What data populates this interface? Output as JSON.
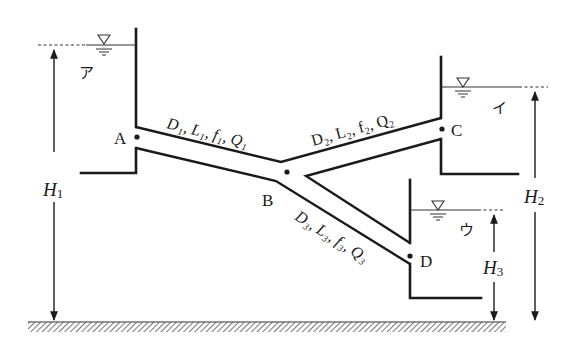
{
  "diagram": {
    "reservoirs": [
      {
        "id": "ア",
        "label": "ア",
        "head_label": "H",
        "head_sub": "1"
      },
      {
        "id": "イ",
        "label": "イ",
        "head_label": "H",
        "head_sub": "2"
      },
      {
        "id": "ウ",
        "label": "ウ",
        "head_label": "H",
        "head_sub": "3"
      }
    ],
    "nodes": {
      "A": "A",
      "B": "B",
      "C": "C",
      "D": "D"
    },
    "pipes": [
      {
        "id": "pipe1",
        "from": "A",
        "to": "B",
        "label": "D₁, L₁, f₁, Q₁"
      },
      {
        "id": "pipe2",
        "from": "B",
        "to": "C",
        "label": "D₂, L₂, f₂, Q₂"
      },
      {
        "id": "pipe3",
        "from": "B",
        "to": "D",
        "label": "D₃, L₃, f₃, Q₃"
      }
    ],
    "water_surface_symbol": "▽",
    "ground": "hatched datum line",
    "colors": {
      "line": "#1a1a1a",
      "background": "#ffffff",
      "hatch": "#555555"
    }
  }
}
